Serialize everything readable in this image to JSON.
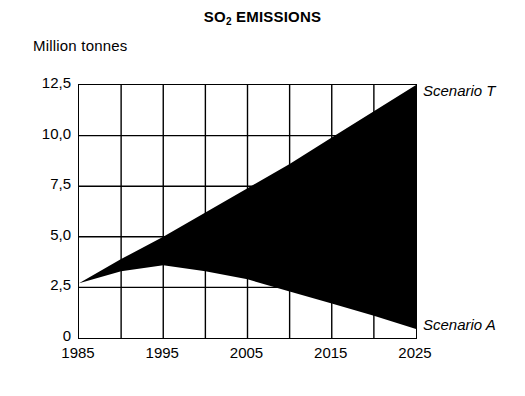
{
  "chart_data": {
    "type": "area",
    "title": "SO2 EMISSIONS",
    "title_main": "SO",
    "title_sub": "2",
    "title_rest": " EMISSIONS",
    "ylabel": "Million tonnes",
    "xlabel": "",
    "xlim": [
      1985,
      2025
    ],
    "ylim": [
      0,
      12.5
    ],
    "grid": true,
    "grid_x_step": 5,
    "grid_y_step": 2.5,
    "legend_position": "right-inline",
    "y_ticks": [
      "0",
      "2,5",
      "5,0",
      "7,5",
      "10,0",
      "12,5"
    ],
    "y_tick_values": [
      0,
      2.5,
      5.0,
      7.5,
      10.0,
      12.5
    ],
    "x_ticks": [
      "1985",
      "1995",
      "2005",
      "2015",
      "2025"
    ],
    "x_tick_values": [
      1985,
      1995,
      2005,
      2015,
      2025
    ],
    "x": [
      1985,
      1990,
      1995,
      2000,
      2005,
      2010,
      2015,
      2020,
      2025
    ],
    "series": [
      {
        "name": "Scenario T",
        "label": "Scenario T",
        "values": [
          2.7,
          3.9,
          5.0,
          6.2,
          7.4,
          8.6,
          9.9,
          11.2,
          12.5
        ]
      },
      {
        "name": "Scenario A",
        "label": "Scenario A",
        "values": [
          2.7,
          3.3,
          3.6,
          3.3,
          2.9,
          2.3,
          1.7,
          1.1,
          0.45
        ]
      }
    ],
    "annotations": [
      {
        "text": "Scenario T",
        "x": 2025,
        "y": 12.5,
        "position": "upper-right"
      },
      {
        "text": "Scenario A",
        "x": 2025,
        "y": 0.45,
        "position": "lower-right"
      }
    ],
    "fill_color": "#000000",
    "axis_color": "#000000",
    "grid_color": "#000000",
    "background_color": "#ffffff"
  }
}
